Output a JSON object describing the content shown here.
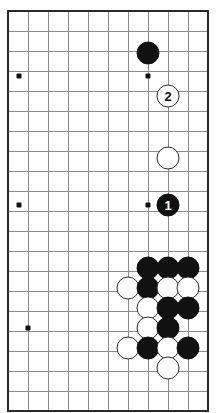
{
  "diagram": {
    "type": "go-board-diagram",
    "board_region": {
      "columns": 10,
      "rows": 20,
      "cell_size": 20,
      "origin_x": 8,
      "origin_y": 11,
      "edges": {
        "top": true,
        "left": true,
        "right": true,
        "bottom": true
      }
    },
    "colors": {
      "background": "#ffffff",
      "grid_line": "#8a8a8a",
      "edge_line": "#2a2a2a",
      "black_stone": "#111111",
      "white_stone": "#ffffff",
      "white_stone_outline": "#2a2a2a",
      "star_point": "#111111"
    },
    "star_points": [
      {
        "x": 19,
        "y": 76
      },
      {
        "x": 148,
        "y": 76
      },
      {
        "x": 19,
        "y": 205
      },
      {
        "x": 148,
        "y": 205
      },
      {
        "x": 28,
        "y": 328
      }
    ],
    "stones": [
      {
        "color": "black",
        "x": 148,
        "y": 53,
        "radius": 11.5,
        "label": ""
      },
      {
        "color": "white",
        "x": 168,
        "y": 96,
        "radius": 11.5,
        "label": "2"
      },
      {
        "color": "white",
        "x": 168,
        "y": 158,
        "radius": 11.5,
        "label": ""
      },
      {
        "color": "black",
        "x": 168,
        "y": 205,
        "radius": 11.5,
        "label": "1"
      },
      {
        "color": "black",
        "x": 148,
        "y": 268,
        "radius": 11.5,
        "label": ""
      },
      {
        "color": "black",
        "x": 168,
        "y": 268,
        "radius": 11.5,
        "label": ""
      },
      {
        "color": "black",
        "x": 188,
        "y": 268,
        "radius": 11.5,
        "label": ""
      },
      {
        "color": "white",
        "x": 128,
        "y": 288,
        "radius": 11.5,
        "label": ""
      },
      {
        "color": "black",
        "x": 148,
        "y": 288,
        "radius": 11.5,
        "label": ""
      },
      {
        "color": "white",
        "x": 168,
        "y": 288,
        "radius": 11.5,
        "label": ""
      },
      {
        "color": "white",
        "x": 188,
        "y": 288,
        "radius": 11.5,
        "label": ""
      },
      {
        "color": "white",
        "x": 148,
        "y": 308,
        "radius": 11.5,
        "label": ""
      },
      {
        "color": "black",
        "x": 168,
        "y": 308,
        "radius": 11.5,
        "label": ""
      },
      {
        "color": "black",
        "x": 188,
        "y": 308,
        "radius": 11.5,
        "label": ""
      },
      {
        "color": "white",
        "x": 148,
        "y": 328,
        "radius": 11.5,
        "label": ""
      },
      {
        "color": "black",
        "x": 168,
        "y": 328,
        "radius": 11.5,
        "label": ""
      },
      {
        "color": "white",
        "x": 128,
        "y": 348,
        "radius": 11.5,
        "label": ""
      },
      {
        "color": "black",
        "x": 148,
        "y": 348,
        "radius": 11.5,
        "label": ""
      },
      {
        "color": "white",
        "x": 168,
        "y": 348,
        "radius": 11.5,
        "label": ""
      },
      {
        "color": "black",
        "x": 188,
        "y": 348,
        "radius": 11.5,
        "label": ""
      },
      {
        "color": "white",
        "x": 168,
        "y": 368,
        "radius": 11.5,
        "label": ""
      }
    ],
    "move_labels": [
      "1",
      "2"
    ]
  }
}
